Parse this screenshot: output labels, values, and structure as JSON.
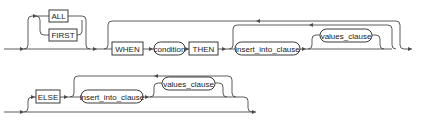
{
  "diagram": {
    "type": "railroad-syntax-diagram",
    "row1": {
      "optional_choice": [
        {
          "label": "ALL",
          "shape": "keyword-box"
        },
        {
          "label": "FIRST",
          "shape": "keyword-box"
        }
      ],
      "when_label": "WHEN",
      "condition_label": "condition",
      "then_label": "THEN",
      "insert_into_clause_label": "insert_into_clause",
      "values_clause_label": "values_clause"
    },
    "row2": {
      "else_label": "ELSE",
      "insert_into_clause_label": "insert_into_clause",
      "values_clause_label": "values_clause"
    },
    "colors": {
      "line": "#4a4a4a",
      "box_border": "#3a3a3a",
      "text": "#222222",
      "background": "#ffffff"
    }
  }
}
